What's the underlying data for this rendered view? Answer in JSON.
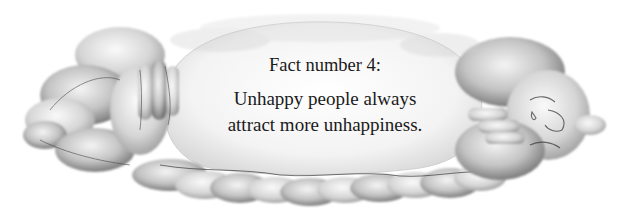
{
  "illustration": {
    "subject": "sad cloud figures holding their faces around a central cloud",
    "style": "grayscale pencil and wash",
    "colors": {
      "background": "#ffffff",
      "cloud_light": "#f2f2f2",
      "cloud_mid": "#bdbdbd",
      "cloud_dark": "#6e6e6e",
      "outline": "#3c3c3c",
      "text": "#1a1a1a"
    }
  },
  "caption": {
    "title": "Fact number 4:",
    "line1": "Unhappy people always",
    "line2": "attract more unhappiness."
  }
}
